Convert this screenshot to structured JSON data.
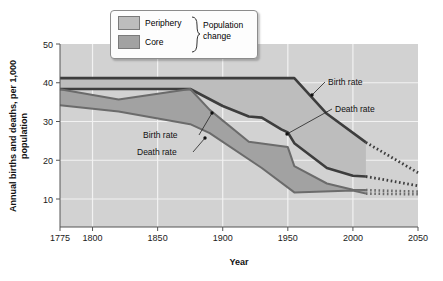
{
  "chart_data": {
    "type": "area",
    "title": "",
    "xlabel": "Year",
    "ylabel": "Annual births and deaths, per 1,000 population",
    "xlim": [
      1775,
      2050
    ],
    "ylim": [
      5,
      50
    ],
    "xticks": [
      1775,
      1800,
      1850,
      1900,
      1950,
      2000,
      2050
    ],
    "xtick_labels": [
      "1775",
      "1800",
      "1850",
      "1900",
      "1950",
      "2000",
      "2050"
    ],
    "yticks": [
      10,
      20,
      30,
      40,
      50
    ],
    "ytick_labels": [
      "10",
      "20",
      "30",
      "40",
      "50"
    ],
    "grid": true,
    "plot_bg": "#d2d2d2",
    "series": [
      {
        "name": "Periphery birth rate",
        "role": "periphery-birth",
        "color": "#3d3d3d",
        "x": [
          1775,
          1875,
          1955,
          1980,
          2010
        ],
        "values": [
          41.2,
          41.2,
          41.2,
          32.0,
          24.6
        ],
        "projection_x": [
          2010,
          2050
        ],
        "projection_values": [
          24.6,
          16.8
        ]
      },
      {
        "name": "Periphery death rate",
        "role": "periphery-death",
        "color": "#3d3d3d",
        "x": [
          1775,
          1875,
          1900,
          1920,
          1930,
          1945,
          1950,
          1955,
          1980,
          2000,
          2010
        ],
        "values": [
          38.4,
          38.4,
          34.0,
          31.3,
          31.0,
          28.0,
          27.2,
          24.4,
          18.0,
          16.0,
          15.8
        ],
        "projection_x": [
          2010,
          2050
        ],
        "projection_values": [
          15.8,
          13.4
        ]
      },
      {
        "name": "Core birth rate",
        "role": "core-birth",
        "color": "#6b6b6b",
        "x": [
          1775,
          1820,
          1875,
          1890,
          1920,
          1950,
          1955,
          1980,
          2000,
          2010
        ],
        "values": [
          38.3,
          35.7,
          38.4,
          33.0,
          24.8,
          23.4,
          18.5,
          14.0,
          12.4,
          12.3
        ],
        "projection_x": [
          2010,
          2050
        ],
        "projection_values": [
          12.3,
          11.9
        ]
      },
      {
        "name": "Core death rate",
        "role": "core-death",
        "color": "#6b6b6b",
        "x": [
          1775,
          1820,
          1875,
          1890,
          1930,
          1955,
          2000,
          2010
        ],
        "values": [
          34.2,
          32.6,
          29.3,
          27.0,
          18.0,
          11.7,
          12.2,
          11.4
        ],
        "projection_x": [
          2010,
          2050
        ],
        "projection_values": [
          11.4,
          11.2
        ]
      }
    ],
    "bands": [
      {
        "name": "Periphery",
        "upper": "periphery-birth",
        "lower": "periphery-death",
        "color": "#bdbdbd"
      },
      {
        "name": "Core",
        "upper": "core-birth",
        "lower": "core-death",
        "color": "#a2a2a2"
      }
    ],
    "annotations": [
      {
        "label": "Birth rate",
        "group": "periphery",
        "text_x": 328,
        "text_y": 85,
        "tip_x": 312,
        "tip_y": 95
      },
      {
        "label": "Death rate",
        "group": "periphery",
        "text_x": 335,
        "text_y": 112,
        "tip_x": 287,
        "tip_y": 134
      },
      {
        "label": "Birth rate",
        "group": "core",
        "text_x": 143,
        "text_y": 138,
        "tip_x": 212,
        "tip_y": 113
      },
      {
        "label": "Death rate",
        "group": "core",
        "text_x": 137,
        "text_y": 155,
        "tip_x": 205,
        "tip_y": 138
      }
    ]
  },
  "legend": {
    "items": [
      {
        "label": "Periphery",
        "color": "#bdbdbd"
      },
      {
        "label": "Core",
        "color": "#a2a2a2"
      }
    ],
    "group_label_line1": "Population",
    "group_label_line2": "change"
  }
}
